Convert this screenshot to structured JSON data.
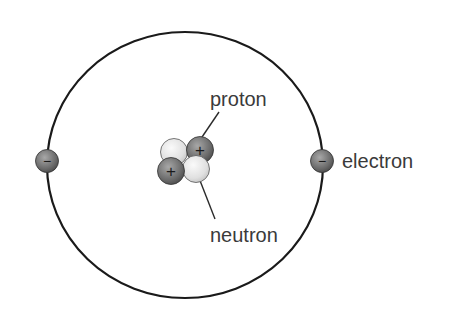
{
  "labels": {
    "proton": "proton",
    "neutron": "neutron",
    "electron": "electron"
  },
  "symbols": {
    "positive": "+",
    "negative": "−"
  },
  "particles": {
    "electrons": 2,
    "protons": 2,
    "neutrons": 2
  },
  "colors": {
    "orbit": "#1a1a1a",
    "proton_fill": "#6e6e6e",
    "neutron_fill": "#e4e4e4",
    "electron_fill": "#7a7a7a",
    "label_text": "#3a3a3a"
  }
}
